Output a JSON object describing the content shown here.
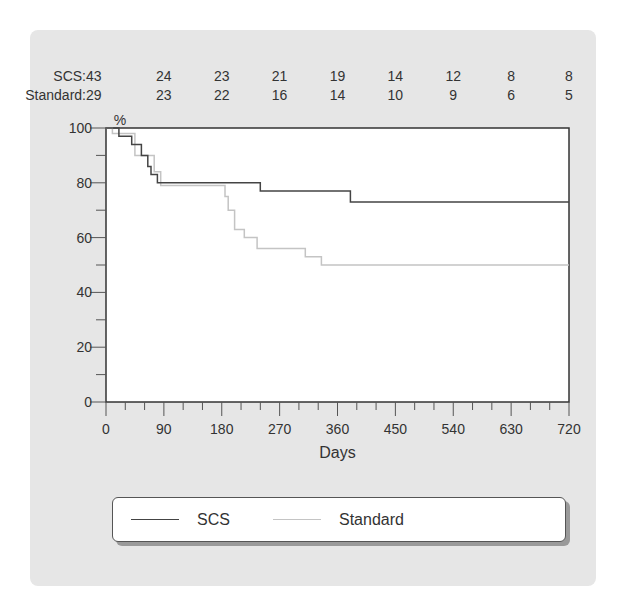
{
  "chart_data": {
    "type": "line",
    "subtype": "kaplan-meier-step",
    "title": "",
    "xlabel": "Days",
    "ylabel": "%",
    "xlim": [
      0,
      720
    ],
    "ylim": [
      0,
      100
    ],
    "x_ticks": [
      0,
      90,
      180,
      270,
      360,
      450,
      540,
      630,
      720
    ],
    "y_ticks": [
      0,
      20,
      40,
      60,
      80,
      100
    ],
    "grid": false,
    "legend_position": "bottom",
    "number_at_risk": {
      "times": [
        0,
        90,
        180,
        270,
        360,
        450,
        540,
        630,
        720
      ],
      "rows": [
        {
          "label": "SCS:",
          "values": [
            43,
            24,
            23,
            21,
            19,
            14,
            12,
            8,
            8
          ]
        },
        {
          "label": "Standard:",
          "values": [
            29,
            23,
            22,
            16,
            14,
            10,
            9,
            6,
            5
          ]
        }
      ]
    },
    "series": [
      {
        "name": "SCS",
        "color": "#444444",
        "steps": [
          [
            0,
            100
          ],
          [
            20,
            100
          ],
          [
            20,
            97
          ],
          [
            40,
            97
          ],
          [
            40,
            94
          ],
          [
            55,
            94
          ],
          [
            55,
            90
          ],
          [
            65,
            90
          ],
          [
            65,
            86
          ],
          [
            70,
            86
          ],
          [
            70,
            83
          ],
          [
            80,
            83
          ],
          [
            80,
            80
          ],
          [
            240,
            80
          ],
          [
            240,
            77
          ],
          [
            380,
            77
          ],
          [
            380,
            73
          ],
          [
            720,
            73
          ]
        ]
      },
      {
        "name": "Standard",
        "color": "#c4c4c4",
        "steps": [
          [
            0,
            100
          ],
          [
            10,
            100
          ],
          [
            10,
            98
          ],
          [
            45,
            98
          ],
          [
            45,
            90
          ],
          [
            75,
            90
          ],
          [
            75,
            84
          ],
          [
            85,
            84
          ],
          [
            85,
            79
          ],
          [
            185,
            79
          ],
          [
            185,
            75
          ],
          [
            190,
            75
          ],
          [
            190,
            70
          ],
          [
            200,
            70
          ],
          [
            200,
            63
          ],
          [
            215,
            63
          ],
          [
            215,
            60
          ],
          [
            235,
            60
          ],
          [
            235,
            56
          ],
          [
            310,
            56
          ],
          [
            310,
            53
          ],
          [
            335,
            53
          ],
          [
            335,
            50
          ],
          [
            720,
            50
          ]
        ]
      }
    ]
  },
  "legend": {
    "items": [
      {
        "label": "SCS",
        "color": "#444444"
      },
      {
        "label": "Standard",
        "color": "#c4c4c4"
      }
    ]
  }
}
